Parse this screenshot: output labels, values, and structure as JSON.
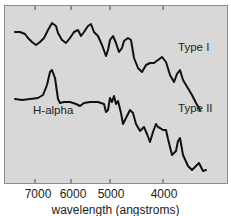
{
  "chart_data": {
    "type": "line",
    "title": "",
    "xlabel": "wavelength (angstroms)",
    "ylabel": "",
    "x_ticks": [
      7000,
      6000,
      5000,
      4000
    ],
    "x_tick_labels": [
      "7000",
      "6000",
      "5000",
      "4000"
    ],
    "xlim": [
      7700,
      3300
    ],
    "x_reversed": true,
    "grid": false,
    "legend": "inline labels",
    "series": [
      {
        "name": "Type I",
        "label": "Type I",
        "points": [
          [
            15,
            32
          ],
          [
            20,
            32
          ],
          [
            25,
            34
          ],
          [
            28,
            38
          ],
          [
            32,
            42
          ],
          [
            36,
            45
          ],
          [
            40,
            42
          ],
          [
            44,
            38
          ],
          [
            48,
            30
          ],
          [
            52,
            23
          ],
          [
            56,
            26
          ],
          [
            58,
            33
          ],
          [
            62,
            40
          ],
          [
            66,
            43
          ],
          [
            70,
            38
          ],
          [
            74,
            32
          ],
          [
            78,
            30
          ],
          [
            81,
            36
          ],
          [
            84,
            32
          ],
          [
            88,
            26
          ],
          [
            91,
            24
          ],
          [
            94,
            32
          ],
          [
            98,
            36
          ],
          [
            102,
            45
          ],
          [
            106,
            56
          ],
          [
            108,
            50
          ],
          [
            110,
            40
          ],
          [
            113,
            36
          ],
          [
            116,
            43
          ],
          [
            119,
            52
          ],
          [
            122,
            48
          ],
          [
            124,
            41
          ],
          [
            128,
            38
          ],
          [
            131,
            40
          ],
          [
            134,
            58
          ],
          [
            138,
            68
          ],
          [
            142,
            72
          ],
          [
            146,
            65
          ],
          [
            150,
            63
          ],
          [
            154,
            63
          ],
          [
            158,
            60
          ],
          [
            162,
            57
          ],
          [
            166,
            62
          ],
          [
            170,
            75
          ],
          [
            174,
            82
          ],
          [
            177,
            74
          ],
          [
            180,
            70
          ],
          [
            183,
            80
          ],
          [
            186,
            85
          ],
          [
            189,
            90
          ],
          [
            192,
            95
          ],
          [
            196,
            103
          ],
          [
            200,
            110
          ]
        ]
      },
      {
        "name": "Type II",
        "label": "Type II",
        "annotation": "H-alpha",
        "points": [
          [
            15,
            99
          ],
          [
            22,
            100
          ],
          [
            30,
            99
          ],
          [
            38,
            98
          ],
          [
            43,
            95
          ],
          [
            47,
            85
          ],
          [
            50,
            72
          ],
          [
            52,
            70
          ],
          [
            55,
            78
          ],
          [
            58,
            99
          ],
          [
            60,
            103
          ],
          [
            64,
            102
          ],
          [
            70,
            102
          ],
          [
            76,
            104
          ],
          [
            80,
            106
          ],
          [
            84,
            103
          ],
          [
            90,
            102
          ],
          [
            98,
            102
          ],
          [
            104,
            104
          ],
          [
            106,
            112
          ],
          [
            108,
            110
          ],
          [
            110,
            98
          ],
          [
            112,
            102
          ],
          [
            114,
            96
          ],
          [
            116,
            104
          ],
          [
            118,
            101
          ],
          [
            121,
            113
          ],
          [
            123,
            124
          ],
          [
            126,
            118
          ],
          [
            130,
            110
          ],
          [
            133,
            113
          ],
          [
            136,
            124
          ],
          [
            140,
            131
          ],
          [
            144,
            127
          ],
          [
            147,
            134
          ],
          [
            150,
            142
          ],
          [
            153,
            132
          ],
          [
            156,
            124
          ],
          [
            158,
            127
          ],
          [
            160,
            128
          ],
          [
            163,
            130
          ],
          [
            166,
            130
          ],
          [
            168,
            139
          ],
          [
            172,
            155
          ],
          [
            176,
            151
          ],
          [
            178,
            141
          ],
          [
            180,
            138
          ],
          [
            183,
            155
          ],
          [
            188,
            166
          ],
          [
            192,
            170
          ],
          [
            196,
            166
          ],
          [
            199,
            163
          ],
          [
            203,
            171
          ],
          [
            206,
            170
          ]
        ]
      }
    ],
    "annotations": [
      {
        "text": "Type I",
        "x_px": 178,
        "y_px": 47
      },
      {
        "text": "Type II",
        "x_px": 178,
        "y_px": 108
      },
      {
        "text": "H-alpha",
        "x_px": 33,
        "y_px": 110
      }
    ]
  },
  "labels": {
    "type1": "Type I",
    "type2": "Type II",
    "halpha": "H-alpha",
    "xlabel": "wavelength (angstroms)",
    "ticks": [
      "7000",
      "6000",
      "5000",
      "4000"
    ]
  }
}
